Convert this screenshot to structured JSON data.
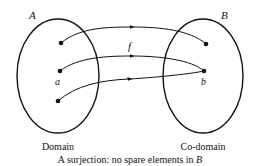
{
  "diagram": {
    "type": "function-mapping",
    "sets": [
      {
        "id": "A",
        "name": "A",
        "caption": "Domain",
        "element_labels": [
          "a"
        ]
      },
      {
        "id": "B",
        "name": "B",
        "caption": "Co-domain",
        "element_labels": [
          "b"
        ]
      }
    ],
    "function_label": "f",
    "mappings": [
      {
        "from": "A.1",
        "to": "B.1"
      },
      {
        "from": "A.2 (a)",
        "to": "B.2 (b)"
      },
      {
        "from": "A.3",
        "to": "B.2 (b)"
      }
    ],
    "caption_prefix": "A surjection: no spare elements in ",
    "caption_set": "B"
  }
}
